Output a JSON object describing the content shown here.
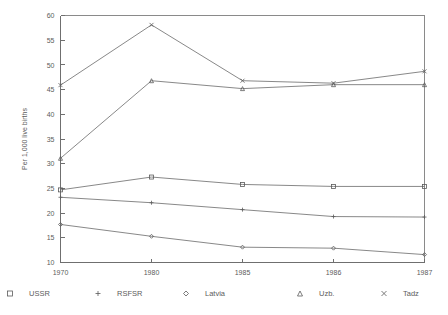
{
  "chart_data": {
    "type": "line",
    "title": "",
    "xlabel": "",
    "ylabel": "Per 1,000 live births",
    "categories": [
      "1970",
      "1980",
      "1985",
      "1986",
      "1987"
    ],
    "x_tick_labels": [
      "1970",
      "1980",
      "1985",
      "1986",
      "1987"
    ],
    "y_tick_labels": [
      "10",
      "15",
      "20",
      "25",
      "30",
      "35",
      "40",
      "45",
      "50",
      "55",
      "60"
    ],
    "y_ticks": [
      10,
      15,
      20,
      25,
      30,
      35,
      40,
      45,
      50,
      55,
      60
    ],
    "ylim": [
      10,
      60
    ],
    "grid": false,
    "legend_position": "bottom",
    "series": [
      {
        "name": "USSR",
        "marker": "square",
        "values": [
          24.7,
          27.3,
          25.8,
          25.4,
          25.4
        ]
      },
      {
        "name": "RSFSR",
        "marker": "plus",
        "values": [
          23.2,
          22.1,
          20.7,
          19.3,
          19.2
        ]
      },
      {
        "name": "Latvia",
        "marker": "diamond",
        "values": [
          17.7,
          15.3,
          13.1,
          12.9,
          11.6
        ]
      },
      {
        "name": "Uzb.",
        "marker": "triangle",
        "values": [
          31.1,
          46.8,
          45.2,
          46.0,
          46.0
        ]
      },
      {
        "name": "Tadz",
        "marker": "cross",
        "values": [
          45.9,
          58.1,
          46.8,
          46.3,
          48.7
        ]
      }
    ]
  },
  "legend": {
    "items": [
      {
        "label": "USSR",
        "marker": "square"
      },
      {
        "label": "RSFSR",
        "marker": "plus"
      },
      {
        "label": "Latvia",
        "marker": "diamond"
      },
      {
        "label": "Uzb.",
        "marker": "triangle"
      },
      {
        "label": "Tadz",
        "marker": "cross"
      }
    ]
  },
  "colors": {
    "line": "#6a6a6a",
    "axis": "#6f6f6f",
    "text": "#5c5c5c",
    "background": "#ffffff"
  }
}
